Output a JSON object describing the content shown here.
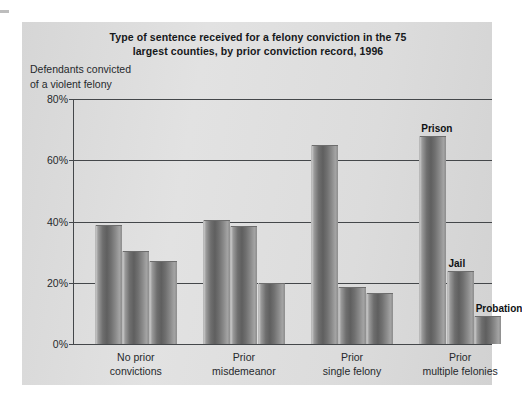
{
  "figure": {
    "title": "Type of sentence received for a felony conviction in the 75 largest counties, by prior conviction record, 1996",
    "title_line_1": "Type of sentence received for a felony conviction in the 75",
    "title_line_2": "largest counties, by prior conviction record, 1996",
    "y_axis_caption_line_1": "Defendants convicted",
    "y_axis_caption_line_2": "of a violent felony",
    "panel_background": "#dedede",
    "bar_color_dark": "#5f5f5f",
    "bar_color_light": "#c9c9c9",
    "axis_color": "#44474a"
  },
  "chart_data": {
    "type": "bar",
    "title": "Type of sentence received for a felony conviction in the 75 largest counties, by prior conviction record, 1996",
    "xlabel": "",
    "ylabel": "Defendants convicted of a violent felony",
    "ylim": [
      0,
      80
    ],
    "y_unit": "%",
    "yticks": [
      0,
      20,
      40,
      60,
      80
    ],
    "ytick_labels": [
      "0%",
      "20%",
      "40%",
      "60%",
      "80%"
    ],
    "grid": true,
    "grid_axis": "y",
    "legend": "inline-annotations",
    "categories": [
      "No prior convictions",
      "Prior misdemeanor",
      "Prior single felony",
      "Prior multiple felonies"
    ],
    "category_lines": [
      [
        "No prior",
        "convictions"
      ],
      [
        "Prior",
        "misdemeanor"
      ],
      [
        "Prior",
        "single felony"
      ],
      [
        "Prior",
        "multiple felonies"
      ]
    ],
    "series": [
      {
        "name": "Prison",
        "values": [
          39,
          40.5,
          65,
          68
        ]
      },
      {
        "name": "Jail",
        "values": [
          30.5,
          38.5,
          18.5,
          24
        ]
      },
      {
        "name": "Probation",
        "values": [
          27,
          20,
          16.5,
          9
        ]
      }
    ],
    "annotations": [
      {
        "text": "Prison",
        "series": "Prison",
        "category": "Prior multiple felonies"
      },
      {
        "text": "Jail",
        "series": "Jail",
        "category": "Prior multiple felonies"
      },
      {
        "text": "Probation",
        "series": "Probation",
        "category": "Prior multiple felonies"
      }
    ]
  }
}
